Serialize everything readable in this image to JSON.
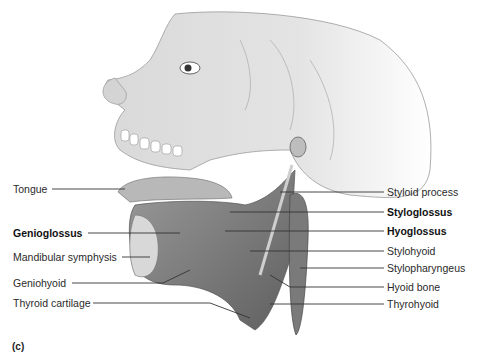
{
  "figure": {
    "panel_label": "(c)",
    "palette": {
      "background": "#ffffff",
      "bone": "#e6e6e6",
      "bone_shadow": "#bdbdbd",
      "muscle": "#8a8a8a",
      "muscle_dark": "#5e5e5e",
      "line": "#333333"
    }
  },
  "labels_left": [
    {
      "text": "Tongue",
      "bold": false
    },
    {
      "text": "Genioglossus",
      "bold": true
    },
    {
      "text": "Mandibular symphysis",
      "bold": false
    },
    {
      "text": "Geniohyoid",
      "bold": false
    },
    {
      "text": "Thyroid cartilage",
      "bold": false
    }
  ],
  "labels_right": [
    {
      "text": "Styloid process",
      "bold": false
    },
    {
      "text": "Styloglossus",
      "bold": true
    },
    {
      "text": "Hyoglossus",
      "bold": true
    },
    {
      "text": "Stylohyoid",
      "bold": false
    },
    {
      "text": "Stylopharyngeus",
      "bold": false
    },
    {
      "text": "Hyoid bone",
      "bold": false
    },
    {
      "text": "Thyrohyoid",
      "bold": false
    }
  ]
}
